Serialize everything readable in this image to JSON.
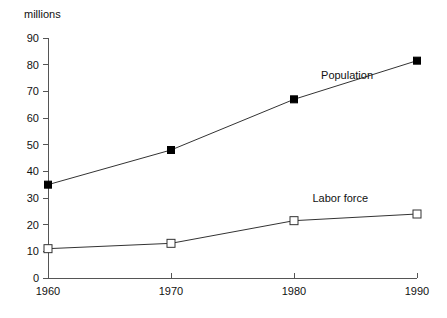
{
  "chart_data": {
    "type": "line",
    "title": "",
    "subtitle": "",
    "xlabel": "",
    "ylabel": "millions",
    "x": [
      1960,
      1970,
      1980,
      1990
    ],
    "xtick_labels": [
      "1960",
      "1970",
      "1980",
      "1990"
    ],
    "ytick_labels": [
      "0",
      "10",
      "20",
      "30",
      "40",
      "50",
      "60",
      "70",
      "80",
      "90"
    ],
    "yticks": [
      0,
      10,
      20,
      30,
      40,
      50,
      60,
      70,
      80,
      90
    ],
    "xlim": [
      1960,
      1990
    ],
    "ylim": [
      0,
      90
    ],
    "grid": false,
    "legend_position": "inline-annotation",
    "series": [
      {
        "name": "Population",
        "values": [
          35,
          48,
          67,
          81.5
        ],
        "marker": "filled-square",
        "label_text": "Population"
      },
      {
        "name": "Labor force",
        "values": [
          11,
          13,
          21.5,
          24
        ],
        "marker": "open-square",
        "label_text": "Labor force"
      }
    ],
    "annotations": [
      {
        "text": "Population",
        "x": 1982.2,
        "y": 74.5
      },
      {
        "text": "Labor force",
        "x": 1981.5,
        "y": 28.5
      }
    ],
    "colors": {
      "line": "#333333",
      "marker_fill": "#000000",
      "marker_open_fill": "#ffffff",
      "axis": "#555555",
      "text": "#111111",
      "background": "#ffffff"
    }
  }
}
